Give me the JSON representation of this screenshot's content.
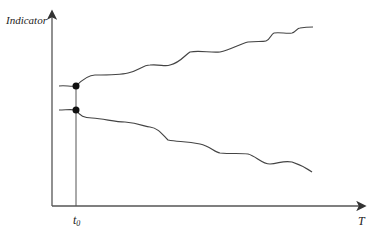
{
  "diagram": {
    "y_axis_label": "Indicator",
    "x_axis_label": "T",
    "marker_label": "t",
    "marker_subscript": "0",
    "line_color": "#333333",
    "curves": [
      {
        "name": "upper-curve",
        "trend": "rising"
      },
      {
        "name": "lower-curve",
        "trend": "falling"
      }
    ]
  }
}
